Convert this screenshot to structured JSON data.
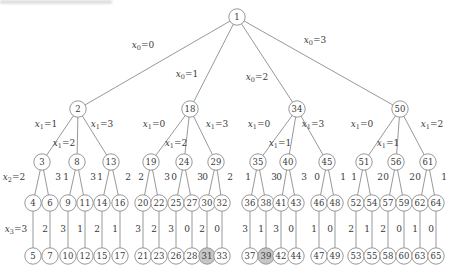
{
  "canvas": {
    "width": 464,
    "height": 276,
    "background": "#ffffff"
  },
  "style": {
    "edge_color": "#8c8c8c",
    "node_stroke": "#8c8c8c",
    "node_fill": "#ffffff",
    "node_fill_shaded": "#c6c6c6",
    "text_color": "#3a3a3a"
  },
  "artifact": {
    "description": "faint cropped text remnant along top-left edge"
  },
  "tree": {
    "node_radius": 8.2,
    "shaded_nodes": [
      31,
      39
    ],
    "nodes": [
      {
        "id": 1,
        "x": 237,
        "y": 17
      },
      {
        "id": 2,
        "x": 78,
        "y": 109
      },
      {
        "id": 18,
        "x": 190,
        "y": 109
      },
      {
        "id": 34,
        "x": 297,
        "y": 109
      },
      {
        "id": 50,
        "x": 400,
        "y": 109
      },
      {
        "id": 3,
        "x": 42,
        "y": 162
      },
      {
        "id": 8,
        "x": 77,
        "y": 162
      },
      {
        "id": 13,
        "x": 111,
        "y": 162
      },
      {
        "id": 19,
        "x": 151,
        "y": 162
      },
      {
        "id": 24,
        "x": 184,
        "y": 162
      },
      {
        "id": 29,
        "x": 216,
        "y": 162
      },
      {
        "id": 35,
        "x": 258,
        "y": 162
      },
      {
        "id": 40,
        "x": 288,
        "y": 162
      },
      {
        "id": 45,
        "x": 327,
        "y": 162
      },
      {
        "id": 51,
        "x": 364,
        "y": 162
      },
      {
        "id": 56,
        "x": 396,
        "y": 162
      },
      {
        "id": 61,
        "x": 428,
        "y": 162
      },
      {
        "id": 4,
        "x": 33,
        "y": 203
      },
      {
        "id": 6,
        "x": 50,
        "y": 203
      },
      {
        "id": 9,
        "x": 68,
        "y": 203
      },
      {
        "id": 11,
        "x": 85,
        "y": 203
      },
      {
        "id": 14,
        "x": 102,
        "y": 203
      },
      {
        "id": 16,
        "x": 120,
        "y": 203
      },
      {
        "id": 20,
        "x": 143,
        "y": 203
      },
      {
        "id": 22,
        "x": 159,
        "y": 203
      },
      {
        "id": 25,
        "x": 176,
        "y": 203
      },
      {
        "id": 27,
        "x": 192,
        "y": 203
      },
      {
        "id": 30,
        "x": 207,
        "y": 203
      },
      {
        "id": 32,
        "x": 222,
        "y": 203
      },
      {
        "id": 36,
        "x": 250,
        "y": 203
      },
      {
        "id": 38,
        "x": 266,
        "y": 203
      },
      {
        "id": 41,
        "x": 281,
        "y": 203
      },
      {
        "id": 43,
        "x": 296,
        "y": 203
      },
      {
        "id": 46,
        "x": 319,
        "y": 203
      },
      {
        "id": 48,
        "x": 335,
        "y": 203
      },
      {
        "id": 52,
        "x": 356,
        "y": 203
      },
      {
        "id": 54,
        "x": 372,
        "y": 203
      },
      {
        "id": 57,
        "x": 388,
        "y": 203
      },
      {
        "id": 59,
        "x": 404,
        "y": 203
      },
      {
        "id": 62,
        "x": 420,
        "y": 203
      },
      {
        "id": 64,
        "x": 436,
        "y": 203
      },
      {
        "id": 5,
        "x": 33,
        "y": 256
      },
      {
        "id": 7,
        "x": 50,
        "y": 256
      },
      {
        "id": 10,
        "x": 68,
        "y": 256
      },
      {
        "id": 12,
        "x": 85,
        "y": 256
      },
      {
        "id": 15,
        "x": 102,
        "y": 256
      },
      {
        "id": 17,
        "x": 120,
        "y": 256
      },
      {
        "id": 21,
        "x": 143,
        "y": 256
      },
      {
        "id": 23,
        "x": 159,
        "y": 256
      },
      {
        "id": 26,
        "x": 176,
        "y": 256
      },
      {
        "id": 28,
        "x": 192,
        "y": 256
      },
      {
        "id": 31,
        "x": 207,
        "y": 256
      },
      {
        "id": 33,
        "x": 222,
        "y": 256
      },
      {
        "id": 37,
        "x": 250,
        "y": 256
      },
      {
        "id": 39,
        "x": 266,
        "y": 256
      },
      {
        "id": 42,
        "x": 281,
        "y": 256
      },
      {
        "id": 44,
        "x": 296,
        "y": 256
      },
      {
        "id": 47,
        "x": 319,
        "y": 256
      },
      {
        "id": 49,
        "x": 335,
        "y": 256
      },
      {
        "id": 53,
        "x": 356,
        "y": 256
      },
      {
        "id": 55,
        "x": 372,
        "y": 256
      },
      {
        "id": 58,
        "x": 388,
        "y": 256
      },
      {
        "id": 60,
        "x": 404,
        "y": 256
      },
      {
        "id": 63,
        "x": 420,
        "y": 256
      },
      {
        "id": 65,
        "x": 436,
        "y": 256
      }
    ],
    "edges": [
      {
        "from": 1,
        "to": 2,
        "label": "x_0=0",
        "lx": 143,
        "ly": 48
      },
      {
        "from": 1,
        "to": 18,
        "label": "x_0=1",
        "lx": 187,
        "ly": 77
      },
      {
        "from": 1,
        "to": 34,
        "label": "x_0=2",
        "lx": 257,
        "ly": 80
      },
      {
        "from": 1,
        "to": 50,
        "label": "x_0=3",
        "lx": 315,
        "ly": 43
      },
      {
        "from": 2,
        "to": 3,
        "label": "x_1=1",
        "lx": 46,
        "ly": 127
      },
      {
        "from": 2,
        "to": 8,
        "label": "x_1=2",
        "lx": 64,
        "ly": 146
      },
      {
        "from": 2,
        "to": 13,
        "label": "x_1=3",
        "lx": 102,
        "ly": 127
      },
      {
        "from": 18,
        "to": 19,
        "label": "x_1=0",
        "lx": 154,
        "ly": 127
      },
      {
        "from": 18,
        "to": 24,
        "label": "x_1=2",
        "lx": 176,
        "ly": 146
      },
      {
        "from": 18,
        "to": 29,
        "label": "x_1=3",
        "lx": 217,
        "ly": 127
      },
      {
        "from": 34,
        "to": 35,
        "label": "x_1=0",
        "lx": 259,
        "ly": 127
      },
      {
        "from": 34,
        "to": 40,
        "label": "x_1=1",
        "lx": 280,
        "ly": 146
      },
      {
        "from": 34,
        "to": 45,
        "label": "x_1=3",
        "lx": 313,
        "ly": 127
      },
      {
        "from": 50,
        "to": 51,
        "label": "x_1=0",
        "lx": 362,
        "ly": 127
      },
      {
        "from": 50,
        "to": 56,
        "label": "x_1=1",
        "lx": 388,
        "ly": 146
      },
      {
        "from": 50,
        "to": 61,
        "label": "x_1=2",
        "lx": 432,
        "ly": 127
      },
      {
        "from": 3,
        "to": 4,
        "label": "x_2=2",
        "lx": 14,
        "ly": 180
      },
      {
        "from": 3,
        "to": 6,
        "label": "3",
        "lx": 58,
        "ly": 180
      },
      {
        "from": 8,
        "to": 9,
        "label": "1",
        "lx": 66,
        "ly": 180
      },
      {
        "from": 8,
        "to": 11,
        "label": "3",
        "lx": 93,
        "ly": 180
      },
      {
        "from": 13,
        "to": 14,
        "label": "1",
        "lx": 100,
        "ly": 180
      },
      {
        "from": 13,
        "to": 16,
        "label": "2",
        "lx": 128,
        "ly": 180
      },
      {
        "from": 19,
        "to": 20,
        "label": "2",
        "lx": 141,
        "ly": 180
      },
      {
        "from": 19,
        "to": 22,
        "label": "3",
        "lx": 167,
        "ly": 180
      },
      {
        "from": 24,
        "to": 25,
        "label": "0",
        "lx": 174,
        "ly": 180
      },
      {
        "from": 24,
        "to": 27,
        "label": "3",
        "lx": 200,
        "ly": 180
      },
      {
        "from": 29,
        "to": 30,
        "label": "0",
        "lx": 205,
        "ly": 180
      },
      {
        "from": 29,
        "to": 32,
        "label": "2",
        "lx": 230,
        "ly": 180
      },
      {
        "from": 35,
        "to": 36,
        "label": "1",
        "lx": 248,
        "ly": 180
      },
      {
        "from": 35,
        "to": 38,
        "label": "3",
        "lx": 274,
        "ly": 180
      },
      {
        "from": 40,
        "to": 41,
        "label": "0",
        "lx": 279,
        "ly": 180
      },
      {
        "from": 40,
        "to": 43,
        "label": "3",
        "lx": 304,
        "ly": 180
      },
      {
        "from": 45,
        "to": 46,
        "label": "0",
        "lx": 317,
        "ly": 180
      },
      {
        "from": 45,
        "to": 48,
        "label": "1",
        "lx": 343,
        "ly": 180
      },
      {
        "from": 51,
        "to": 52,
        "label": "1",
        "lx": 354,
        "ly": 180
      },
      {
        "from": 51,
        "to": 54,
        "label": "2",
        "lx": 380,
        "ly": 180
      },
      {
        "from": 56,
        "to": 57,
        "label": "0",
        "lx": 386,
        "ly": 180
      },
      {
        "from": 56,
        "to": 59,
        "label": "2",
        "lx": 412,
        "ly": 180
      },
      {
        "from": 61,
        "to": 62,
        "label": "0",
        "lx": 418,
        "ly": 180
      },
      {
        "from": 61,
        "to": 64,
        "label": "1",
        "lx": 444,
        "ly": 180
      },
      {
        "from": 4,
        "to": 5,
        "label": "x_3=3",
        "lx": 16,
        "ly": 232
      },
      {
        "from": 6,
        "to": 7,
        "label": "2",
        "lx": 45,
        "ly": 232
      },
      {
        "from": 9,
        "to": 10,
        "label": "3",
        "lx": 63,
        "ly": 232
      },
      {
        "from": 11,
        "to": 12,
        "label": "1",
        "lx": 80,
        "ly": 232
      },
      {
        "from": 14,
        "to": 15,
        "label": "2",
        "lx": 97,
        "ly": 232
      },
      {
        "from": 16,
        "to": 17,
        "label": "1",
        "lx": 115,
        "ly": 232
      },
      {
        "from": 20,
        "to": 21,
        "label": "3",
        "lx": 138,
        "ly": 232
      },
      {
        "from": 22,
        "to": 23,
        "label": "2",
        "lx": 154,
        "ly": 232
      },
      {
        "from": 25,
        "to": 26,
        "label": "3",
        "lx": 171,
        "ly": 232
      },
      {
        "from": 27,
        "to": 28,
        "label": "0",
        "lx": 187,
        "ly": 232
      },
      {
        "from": 30,
        "to": 31,
        "label": "2",
        "lx": 202,
        "ly": 232
      },
      {
        "from": 32,
        "to": 33,
        "label": "0",
        "lx": 217,
        "ly": 232
      },
      {
        "from": 36,
        "to": 37,
        "label": "3",
        "lx": 245,
        "ly": 232
      },
      {
        "from": 38,
        "to": 39,
        "label": "1",
        "lx": 261,
        "ly": 232
      },
      {
        "from": 41,
        "to": 42,
        "label": "3",
        "lx": 276,
        "ly": 232
      },
      {
        "from": 43,
        "to": 44,
        "label": "0",
        "lx": 291,
        "ly": 232
      },
      {
        "from": 46,
        "to": 47,
        "label": "1",
        "lx": 314,
        "ly": 232
      },
      {
        "from": 48,
        "to": 49,
        "label": "0",
        "lx": 330,
        "ly": 232
      },
      {
        "from": 52,
        "to": 53,
        "label": "2",
        "lx": 351,
        "ly": 232
      },
      {
        "from": 54,
        "to": 55,
        "label": "1",
        "lx": 367,
        "ly": 232
      },
      {
        "from": 57,
        "to": 58,
        "label": "2",
        "lx": 383,
        "ly": 232
      },
      {
        "from": 59,
        "to": 60,
        "label": "0",
        "lx": 399,
        "ly": 232
      },
      {
        "from": 62,
        "to": 63,
        "label": "1",
        "lx": 415,
        "ly": 232
      },
      {
        "from": 64,
        "to": 65,
        "label": "0",
        "lx": 431,
        "ly": 232
      }
    ]
  }
}
